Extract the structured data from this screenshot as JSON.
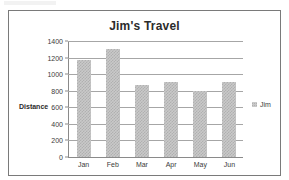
{
  "chart_data": {
    "type": "bar",
    "title": "Jim's Travel",
    "xlabel": "",
    "ylabel": "Distance",
    "categories": [
      "Jan",
      "Feb",
      "Mar",
      "Apr",
      "May",
      "Jun"
    ],
    "series": [
      {
        "name": "Jim",
        "values": [
          1170,
          1300,
          875,
          900,
          800,
          900
        ]
      }
    ],
    "ylim": [
      0,
      1400
    ],
    "ytick_labels": [
      "1400",
      "1200",
      "1000",
      "800",
      "600",
      "400",
      "200",
      "0"
    ],
    "ytick_values": [
      1400,
      1200,
      1000,
      800,
      600,
      400,
      200,
      0
    ],
    "grid": true,
    "legend_position": "right",
    "legend_entries": [
      "Jim"
    ],
    "colors": {
      "bar_fill": "#c9c9c9",
      "bar_pattern": "#b0b0b0",
      "gridline": "#a6a6a6",
      "axis": "#8a8a8a",
      "title_text": "#2b2b2b",
      "tick_text": "#3b3b3b",
      "frame_border": "#7a7a7a",
      "background": "#ffffff"
    }
  }
}
